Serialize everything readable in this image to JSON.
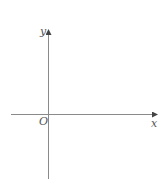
{
  "diagram": {
    "type": "coordinate-axes",
    "axes": {
      "x_label": "x",
      "y_label": "y",
      "origin_label": "O"
    },
    "colors": {
      "axis": "#8a8a8a",
      "label": "#555555",
      "background": "#ffffff"
    }
  }
}
